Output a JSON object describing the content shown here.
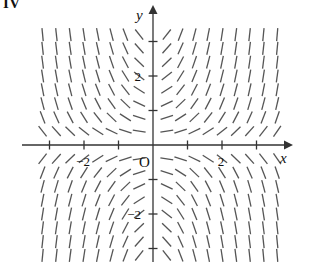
{
  "figure": {
    "label": "IV",
    "kind": "slope-field",
    "stroke_color": "#555555",
    "axis_color": "#333333",
    "background": "#ffffff"
  },
  "axes": {
    "x_label": "x",
    "y_label": "y",
    "origin_label": "O",
    "x_ticks": [
      {
        "value": -3,
        "label": ""
      },
      {
        "value": -2,
        "label": "−2"
      },
      {
        "value": -1,
        "label": ""
      },
      {
        "value": 1,
        "label": ""
      },
      {
        "value": 2,
        "label": "2"
      },
      {
        "value": 3,
        "label": ""
      }
    ],
    "y_ticks": [
      {
        "value": 3,
        "label": ""
      },
      {
        "value": 2,
        "label": "2"
      },
      {
        "value": 1,
        "label": ""
      },
      {
        "value": -1,
        "label": ""
      },
      {
        "value": -2,
        "label": "−2"
      },
      {
        "value": -3,
        "label": ""
      }
    ],
    "xlim": [
      -3.45,
      3.95
    ],
    "ylim": [
      -3.45,
      3.45
    ]
  },
  "chart_data": {
    "type": "scatter",
    "title": "",
    "subtitle": "",
    "xlabel": "x",
    "ylabel": "y",
    "xlim": [
      -3.45,
      3.95
    ],
    "ylim": [
      -3.45,
      3.45
    ],
    "grid": false,
    "legend": null,
    "annotations": [
      "IV"
    ],
    "field": {
      "description": "direction field of dy/dx = x*y (saddle pattern: shallow near axes, steep far out)",
      "slope_formula": "x*y",
      "x_samples": [
        -3.2,
        -2.8,
        -2.4,
        -2.0,
        -1.6,
        -1.2,
        -0.8,
        -0.4,
        0.4,
        0.8,
        1.2,
        1.6,
        2.0,
        2.4,
        2.8,
        3.2,
        3.6
      ],
      "y_samples": [
        3.2,
        2.8,
        2.4,
        2.0,
        1.6,
        1.2,
        0.8,
        0.4,
        -0.4,
        -0.8,
        -1.2,
        -1.6,
        -2.0,
        -2.4,
        -2.8,
        -3.2
      ],
      "segment_length_px": 13,
      "stroke_width_px": 1.3
    }
  }
}
